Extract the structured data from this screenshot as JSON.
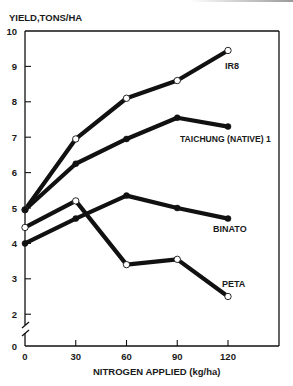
{
  "chart_data": {
    "type": "line",
    "title": "",
    "ylabel": "YIELD,TONS/HA",
    "xlabel": "NITROGEN APPLIED (kg/ha)",
    "x": [
      0,
      30,
      60,
      90,
      120
    ],
    "xticks": [
      "0",
      "30",
      "60",
      "90",
      "120"
    ],
    "yticks": [
      "0",
      "2",
      "3",
      "4",
      "5",
      "6",
      "7",
      "8",
      "9",
      "10"
    ],
    "ylim": [
      0,
      10
    ],
    "y_axis_break": "between 0 and 2",
    "grid": false,
    "legend": "direct labels at line ends",
    "series": [
      {
        "name": "IR8",
        "marker": "open-circle",
        "values": [
          4.95,
          6.95,
          8.1,
          8.6,
          9.45
        ]
      },
      {
        "name": "TAICHUNG (NATIVE) 1",
        "marker": "filled-circle",
        "values": [
          4.95,
          6.25,
          6.95,
          7.55,
          7.3
        ]
      },
      {
        "name": "BINATO",
        "marker": "filled-circle",
        "values": [
          4.0,
          4.7,
          5.35,
          5.0,
          4.7
        ]
      },
      {
        "name": "PETA",
        "marker": "open-circle",
        "values": [
          4.45,
          5.2,
          3.4,
          3.55,
          2.5
        ]
      }
    ]
  },
  "labels": {
    "ylabel": "YIELD,TONS/HA",
    "xlabel": "NITROGEN APPLIED (kg/ha)",
    "series_ir8": "IR8",
    "series_taichung": "TAICHUNG (NATIVE) 1",
    "series_binato": "BINATO",
    "series_peta": "PETA"
  },
  "axes": {
    "y": [
      "10",
      "9",
      "8",
      "7",
      "6",
      "5",
      "4",
      "3",
      "2",
      "0"
    ],
    "x": [
      "0",
      "30",
      "60",
      "90",
      "120"
    ]
  },
  "colors": {
    "line": "#111111",
    "text": "#1a1a1a",
    "background": "#ffffff"
  }
}
